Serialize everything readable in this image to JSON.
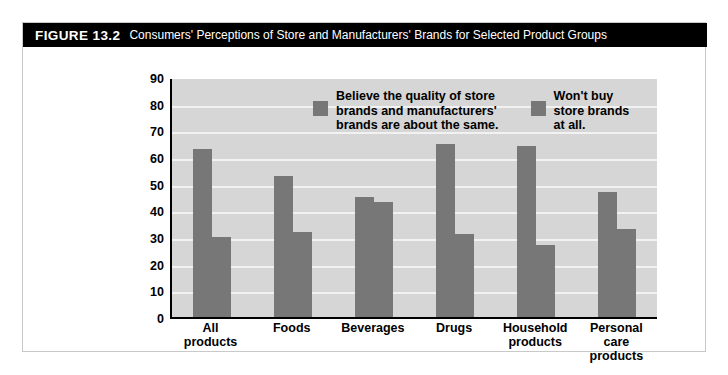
{
  "figure": {
    "label": "FIGURE 13.2",
    "caption": "Consumers' Perceptions of Store and Manufacturers' Brands for Selected Product Groups"
  },
  "legend": {
    "series_1_label": "Believe the quality of store\nbrands and manufacturers'\nbrands are about the same.",
    "series_2_label": "Won't buy\nstore brands\nat all."
  },
  "axis": {
    "ylabel": "Percent responding",
    "yticks": [
      "90",
      "80",
      "70",
      "60",
      "50",
      "40",
      "30",
      "20",
      "10",
      "0"
    ]
  },
  "colors": {
    "bar": "#777777",
    "plot_background": "#d6d6d6",
    "gridline": "#f2f2f2",
    "title_bar": "#000000"
  },
  "chart_data": {
    "type": "bar",
    "title": "Consumers' Perceptions of Store and Manufacturers' Brands for Selected Product Groups",
    "xlabel": "",
    "ylabel": "Percent responding",
    "ylim": [
      0,
      90
    ],
    "ytick_step": 10,
    "grid": true,
    "legend_position": "inside-top-center",
    "categories": [
      "All\nproducts",
      "Foods",
      "Beverages",
      "Drugs",
      "Household\nproducts",
      "Personal\ncare\nproducts"
    ],
    "series": [
      {
        "name": "Believe the quality of store brands and manufacturers' brands are about the same.",
        "values": [
          63,
          53,
          45,
          65,
          64,
          47
        ]
      },
      {
        "name": "Won't buy store brands at all.",
        "values": [
          30,
          32,
          43,
          31,
          27,
          33
        ]
      }
    ]
  }
}
